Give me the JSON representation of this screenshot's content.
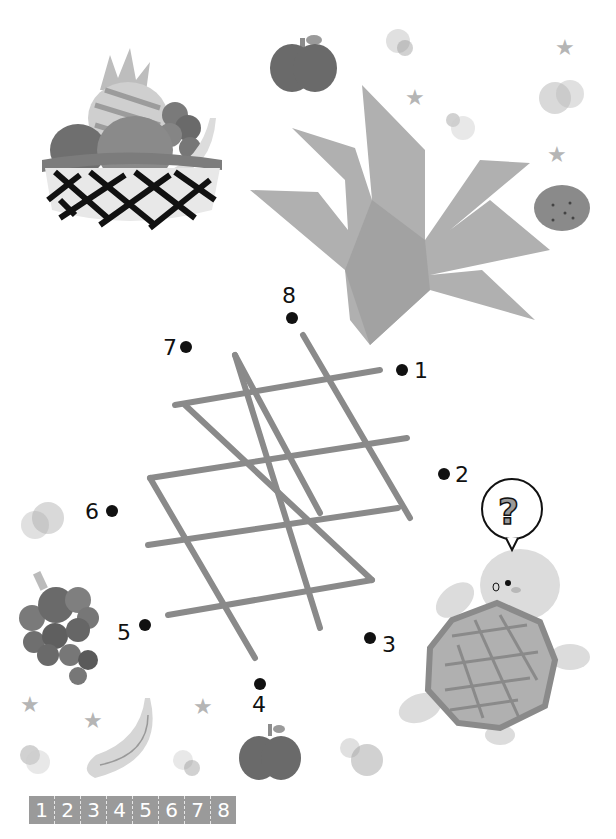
{
  "activity": {
    "type": "dot-to-dot",
    "subject": "pineapple",
    "dots": [
      {
        "n": "1",
        "x": 402,
        "y": 370
      },
      {
        "n": "2",
        "x": 444,
        "y": 474
      },
      {
        "n": "3",
        "x": 370,
        "y": 638
      },
      {
        "n": "4",
        "x": 260,
        "y": 684
      },
      {
        "n": "5",
        "x": 145,
        "y": 625
      },
      {
        "n": "6",
        "x": 112,
        "y": 511
      },
      {
        "n": "7",
        "x": 186,
        "y": 347
      },
      {
        "n": "8",
        "x": 292,
        "y": 318
      }
    ],
    "number_strip": [
      "1",
      "2",
      "3",
      "4",
      "5",
      "6",
      "7",
      "8"
    ]
  },
  "illustrations": {
    "fruit_basket": "fruit-basket",
    "pineapple_crown": "pineapple-leaves",
    "turtle": "turtle",
    "speech_bubble": "?",
    "apple_top": "apple",
    "apple_bottom": "apple",
    "mandarin": "mandarin-orange",
    "grapes": "grapes",
    "banana": "banana"
  },
  "colors": {
    "line": "#8a8a8a",
    "leaf": "#b3b3b3",
    "dot": "#111111",
    "apple": "#6e6e6e",
    "turtle_body": "#dcdcdc",
    "shell": "#a8a8a8"
  }
}
